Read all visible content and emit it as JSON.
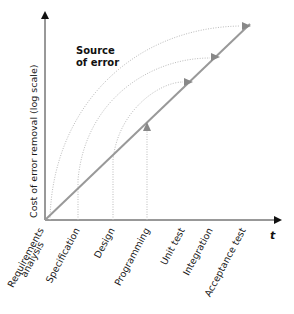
{
  "diagram": {
    "title_line1": "Source",
    "title_line2": "of error",
    "y_axis_label": "Cost of error removal (log scale)",
    "x_axis_label": "t",
    "phases": [
      {
        "label": "Requirements",
        "label2": "analysis"
      },
      {
        "label": "Specification"
      },
      {
        "label": "Design"
      },
      {
        "label": "Programming"
      },
      {
        "label": "Unit test"
      },
      {
        "label": "Integration"
      },
      {
        "label": "Acceptance test"
      }
    ],
    "colors": {
      "axis": "#333333",
      "cost_line": "#999999",
      "dotted_arc": "#bbbbbb",
      "arrowhead": "#888888"
    }
  }
}
